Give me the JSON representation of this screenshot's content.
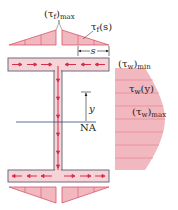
{
  "diagram": {
    "type": "shear-flow-i-beam",
    "colors": {
      "fill": "#f2b8bf",
      "fill_dark": "#e8a0aa",
      "stroke": "#d9546a",
      "outline": "#6b6f80",
      "arrow": "#d0304a",
      "text": "#231f20"
    },
    "labels": {
      "tau_f_max": "(τ",
      "tau_f_max_sub": "f",
      "tau_f_max_tail": ")",
      "tau_f_max_sub2": "max",
      "tau_f_s": "τ",
      "tau_f_s_sub": "f",
      "tau_f_s_tail": "(s)",
      "s": "s",
      "tau_w_min": "(τ",
      "tau_w_min_sub": "w",
      "tau_w_min_tail": ")",
      "tau_w_min_sub2": "min",
      "tau_w_y": "τ",
      "tau_w_y_sub": "w",
      "tau_w_y_tail": "(y)",
      "tau_w_max": "(τ",
      "tau_w_max_sub": "w",
      "tau_w_max_tail": ")",
      "tau_w_max_sub2": "max",
      "y": "y",
      "na": "NA"
    }
  }
}
